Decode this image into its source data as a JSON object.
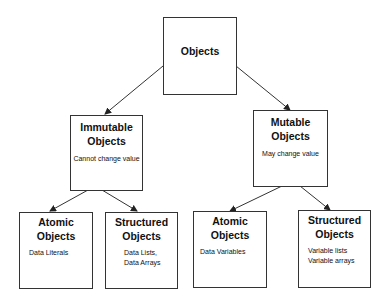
{
  "diagram": {
    "type": "hierarchy",
    "root": {
      "title": "Objects"
    },
    "level2": [
      {
        "title_line1": "Immutable",
        "title_line2": "Objects",
        "description": "Cannot change value"
      },
      {
        "title_line1": "Mutable",
        "title_line2": "Objects",
        "description": "May change value"
      }
    ],
    "level3": [
      {
        "parent": "Immutable Objects",
        "title_line1": "Atomic",
        "title_line2": "Objects",
        "description_lines": [
          "Data  Literals"
        ]
      },
      {
        "parent": "Immutable Objects",
        "title_line1": "Structured",
        "title_line2": "Objects",
        "description_lines": [
          "Data  Lists,",
          "Data  Arrays"
        ]
      },
      {
        "parent": "Mutable Objects",
        "title_line1": "Atomic",
        "title_line2": "Objects",
        "description_lines": [
          "Data  Variables"
        ]
      },
      {
        "parent": "Mutable Objects",
        "title_line1": "Structured",
        "title_line2": "Objects",
        "description_lines": [
          "Variable lists",
          "Variable arrays"
        ]
      }
    ],
    "colors": {
      "line": "#333333",
      "background": "#ffffff",
      "text": "#111111"
    }
  }
}
